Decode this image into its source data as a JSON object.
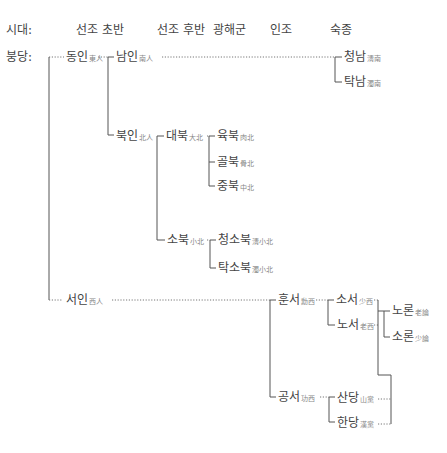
{
  "headers": {
    "era_label": "시대:",
    "col1": "선조 초반",
    "col2": "선조 후반",
    "col3": "광해군",
    "col4": "인조",
    "col5": "숙종"
  },
  "root": {
    "label": "붕당:"
  },
  "nodes": {
    "dongin": {
      "label": "동인",
      "hanja": "東人"
    },
    "namin": {
      "label": "남인",
      "hanja": "南人"
    },
    "cheongnam": {
      "label": "청남",
      "hanja": "淸南"
    },
    "taknam": {
      "label": "탁남",
      "hanja": "濁南"
    },
    "bukin": {
      "label": "북인",
      "hanja": "北人"
    },
    "daebuk": {
      "label": "대북",
      "hanja": "大北"
    },
    "yukbuk": {
      "label": "육북",
      "hanja": "肉北"
    },
    "golbuk": {
      "label": "골북",
      "hanja": "骨北"
    },
    "jungbuk": {
      "label": "중북",
      "hanja": "中北"
    },
    "sobuk": {
      "label": "소북",
      "hanja": "小北"
    },
    "cheongsobuk": {
      "label": "청소북",
      "hanja": "淸小北"
    },
    "taksobuk": {
      "label": "탁소북",
      "hanja": "濁小北"
    },
    "seoin": {
      "label": "서인",
      "hanja": "西人"
    },
    "hunseo": {
      "label": "훈서",
      "hanja": "勳西"
    },
    "soseo": {
      "label": "소서",
      "hanja": "少西"
    },
    "noseo": {
      "label": "노서",
      "hanja": "老西"
    },
    "noron": {
      "label": "노론",
      "hanja": "老論"
    },
    "soron": {
      "label": "소론",
      "hanja": "少論"
    },
    "gongseo": {
      "label": "공서",
      "hanja": "功西"
    },
    "sandang": {
      "label": "산당",
      "hanja": "山黨"
    },
    "handang": {
      "label": "한당",
      "hanja": "漢黨"
    }
  }
}
